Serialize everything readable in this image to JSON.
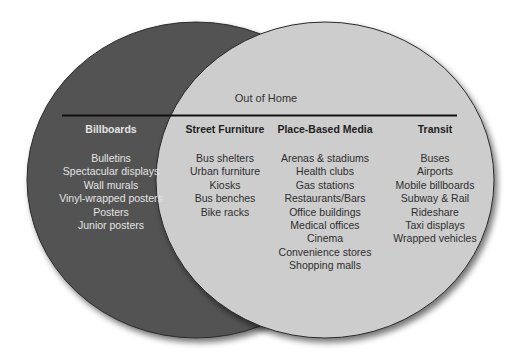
{
  "diagram": {
    "title": "Out of Home",
    "colors": {
      "left_circle": "#525252",
      "right_circle": "#cdcdcd",
      "divider_line": "#111111",
      "background": "#ffffff"
    },
    "left_circle": {
      "heading": "Billboards",
      "items": [
        "Bulletins",
        "Spectacular displays",
        "Wall murals",
        "Vinyl-wrapped posters",
        "Posters",
        "Junior posters"
      ]
    },
    "right_circle": {
      "label": "Out of Home",
      "columns": [
        {
          "heading": "Street Furniture",
          "items": [
            "Bus shelters",
            "Urban furniture",
            "Kiosks",
            "Bus benches",
            "Bike racks"
          ]
        },
        {
          "heading": "Place-Based Media",
          "items": [
            "Arenas & stadiums",
            "Health clubs",
            "Gas stations",
            "Restaurants/Bars",
            "Office buildings",
            "Medical offices",
            "Cinema",
            "Convenience stores",
            "Shopping malls"
          ]
        },
        {
          "heading": "Transit",
          "items": [
            "Buses",
            "Airports",
            "Mobile billboards",
            "Subway & Rail",
            "Rideshare",
            "Taxi displays",
            "Wrapped vehicles"
          ]
        }
      ]
    }
  }
}
